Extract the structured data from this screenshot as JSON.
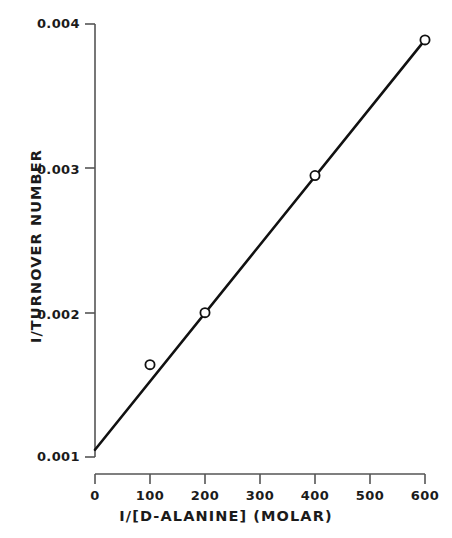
{
  "chart_data": {
    "type": "line",
    "title": "",
    "subtitle": "",
    "xlabel": "I/[D-ALANINE] (MOLAR)",
    "ylabel": "I/TURNOVER NUMBER",
    "xlim": [
      0,
      600
    ],
    "ylim": [
      0.001,
      0.004
    ],
    "xticks": [
      0,
      100,
      200,
      300,
      400,
      500,
      600
    ],
    "xtick_labels": [
      "0",
      "100",
      "200",
      "300",
      "400",
      "500",
      "600"
    ],
    "yticks": [
      0.001,
      0.002,
      0.003,
      0.004
    ],
    "ytick_labels": [
      "0.001",
      "0.002",
      "0.003",
      "0.004"
    ],
    "grid": false,
    "legend": null,
    "marker": "open-circle",
    "line_color": "#111111",
    "marker_edge_color": "#111111",
    "marker_face_color": "#ffffff",
    "series": [
      {
        "name": "1/turnover number vs 1/[D-alanine]",
        "x": [
          100,
          200,
          400,
          600
        ],
        "y": [
          0.00164,
          0.002,
          0.00295,
          0.00389
        ]
      }
    ],
    "fit_line": {
      "name": "least-squares fit",
      "x_start": 0,
      "y_start": 0.00105,
      "x_end": 600,
      "y_end": 0.00389,
      "y_intercept": 0.00105,
      "slope": 4.7333e-06
    },
    "annotations": []
  },
  "axes": {
    "y_title": "I/TURNOVER NUMBER",
    "x_title": "I/[D-ALANINE] (MOLAR)",
    "y_labels": [
      "0.004",
      "0.003",
      "0.002",
      "0.001"
    ],
    "x_labels": [
      "0",
      "100",
      "200",
      "300",
      "400",
      "500",
      "600"
    ]
  },
  "colors": {
    "background": "#ffffff",
    "ink": "#1b1b1b",
    "axis": "#4a4a4a",
    "data": "#111111"
  }
}
